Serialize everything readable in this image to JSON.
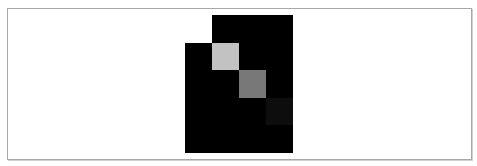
{
  "figure": {
    "columns": 4,
    "rows": 5,
    "background_color": "#000000",
    "cells": [
      {
        "row": 0,
        "col": 0,
        "color": "#ffffff"
      },
      {
        "row": 1,
        "col": 1,
        "color": "#c2c2c2"
      },
      {
        "row": 2,
        "col": 2,
        "color": "#787878"
      },
      {
        "row": 3,
        "col": 3,
        "color": "#0d0d0d"
      }
    ]
  },
  "frame": {
    "border_color": "#a8a8a8"
  }
}
